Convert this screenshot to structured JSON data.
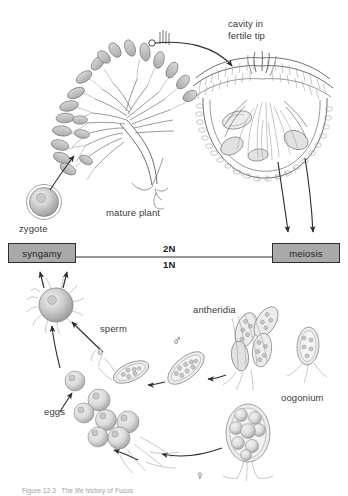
{
  "figure": {
    "caption": "Figure 12.3   The life history of Fucus"
  },
  "labels": {
    "cavity_in_fertile_tip": "cavity in\nfertile tip",
    "mature_plant": "mature plant",
    "zygote": "zygote",
    "antheridia": "antheridia",
    "sperm": "sperm",
    "eggs": "eggs",
    "oogonium": "oogonium"
  },
  "process_boxes": [
    {
      "id": "syngamy",
      "label": "syngamy"
    },
    {
      "id": "meiosis",
      "label": "meiosis"
    }
  ],
  "ploidy": {
    "diploid": "2N",
    "haploid": "1N"
  },
  "sex_symbols": {
    "male": "♂",
    "female": "♀"
  },
  "colors": {
    "box_fill": "#a9a9a9",
    "box_border": "#2e2e2e",
    "arrow": "#2b2b2b",
    "label_text": "#3b3b3b",
    "ploidy_text": "#1a1a1a",
    "background": "#ffffff",
    "art_line": "#6e6e6e"
  }
}
